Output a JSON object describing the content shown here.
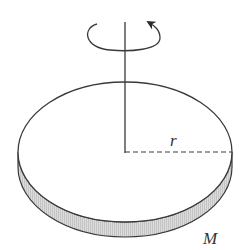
{
  "diagram": {
    "labels": {
      "radius": "r",
      "mass": "M"
    },
    "elements": {
      "axis": "vertical rotation axis",
      "rotation_arrow": "counter-clockwise rotation (viewed from above)",
      "radius_line": "dashed",
      "rim": "shaded"
    },
    "colors": {
      "stroke": "#3a3a3a",
      "rim_fill": "#d4d4d4",
      "background": "#ffffff"
    }
  }
}
